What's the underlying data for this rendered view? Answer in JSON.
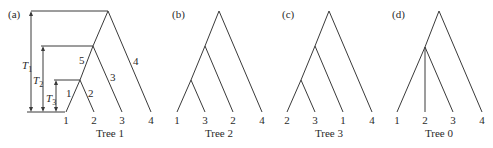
{
  "figure": {
    "panels": [
      {
        "id": "a",
        "panel_label": "(a)",
        "caption": "Tree 1",
        "leaves": [
          "1",
          "2",
          "3",
          "4"
        ],
        "newick": "(((1,2),3),4)",
        "branch_labels": [
          "1",
          "2",
          "3",
          "4",
          "5"
        ],
        "time_labels": [
          {
            "T": "T",
            "sub": "1"
          },
          {
            "T": "T",
            "sub": "2"
          },
          {
            "T": "T",
            "sub": "3"
          }
        ]
      },
      {
        "id": "b",
        "panel_label": "(b)",
        "caption": "Tree 2",
        "leaves": [
          "1",
          "3",
          "2",
          "4"
        ],
        "newick": "(((1,3),2),4)"
      },
      {
        "id": "c",
        "panel_label": "(c)",
        "caption": "Tree 3",
        "leaves": [
          "2",
          "3",
          "1",
          "4"
        ],
        "newick": "(((2,3),1),4)"
      },
      {
        "id": "d",
        "panel_label": "(d)",
        "caption": "Tree 0",
        "leaves": [
          "1",
          "2",
          "3",
          "4"
        ],
        "newick": "((1,2,3),4)"
      }
    ],
    "colors": {
      "line": "#3a3a3a",
      "text": "#2a2a2a",
      "background": "#ffffff"
    }
  }
}
